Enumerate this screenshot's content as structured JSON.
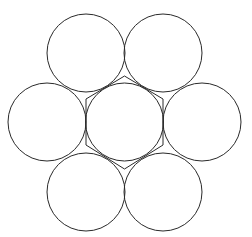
{
  "diagram": {
    "stroke_color": "#2a2a2a",
    "background": "#ffffff",
    "stroke_width": 1,
    "radius": 39,
    "circles": [
      {
        "id": "top-left",
        "cx": 86,
        "cy": 53
      },
      {
        "id": "top-right",
        "cx": 163,
        "cy": 53
      },
      {
        "id": "left",
        "cx": 47,
        "cy": 122
      },
      {
        "id": "center",
        "cx": 124.5,
        "cy": 122
      },
      {
        "id": "right",
        "cx": 202,
        "cy": 122
      },
      {
        "id": "bottom-left",
        "cx": 86,
        "cy": 192
      },
      {
        "id": "bottom-right",
        "cx": 163,
        "cy": 192
      }
    ],
    "hexagon": {
      "points": "124.5,76 86,99 86,145 124.5,169 163,145 163,99"
    }
  }
}
